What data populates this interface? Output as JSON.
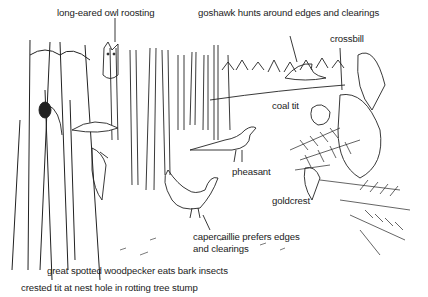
{
  "diagram": {
    "type": "illustrated-scene",
    "labels": {
      "owl": "long-eared owl roosting",
      "goshawk": "goshawk hunts around edges and clearings",
      "crossbill": "crossbill",
      "coal_tit": "coal tit",
      "pheasant": "pheasant",
      "goldcrest": "goldcrest",
      "capercaillie_1": "capercaillie prefers edges",
      "capercaillie_2": "and clearings",
      "woodpecker": "great spotted woodpecker eats bark insects",
      "crested_tit": "crested tit at nest hole in rotting tree stump"
    },
    "colors": {
      "ink": "#222222",
      "background": "#ffffff"
    }
  }
}
